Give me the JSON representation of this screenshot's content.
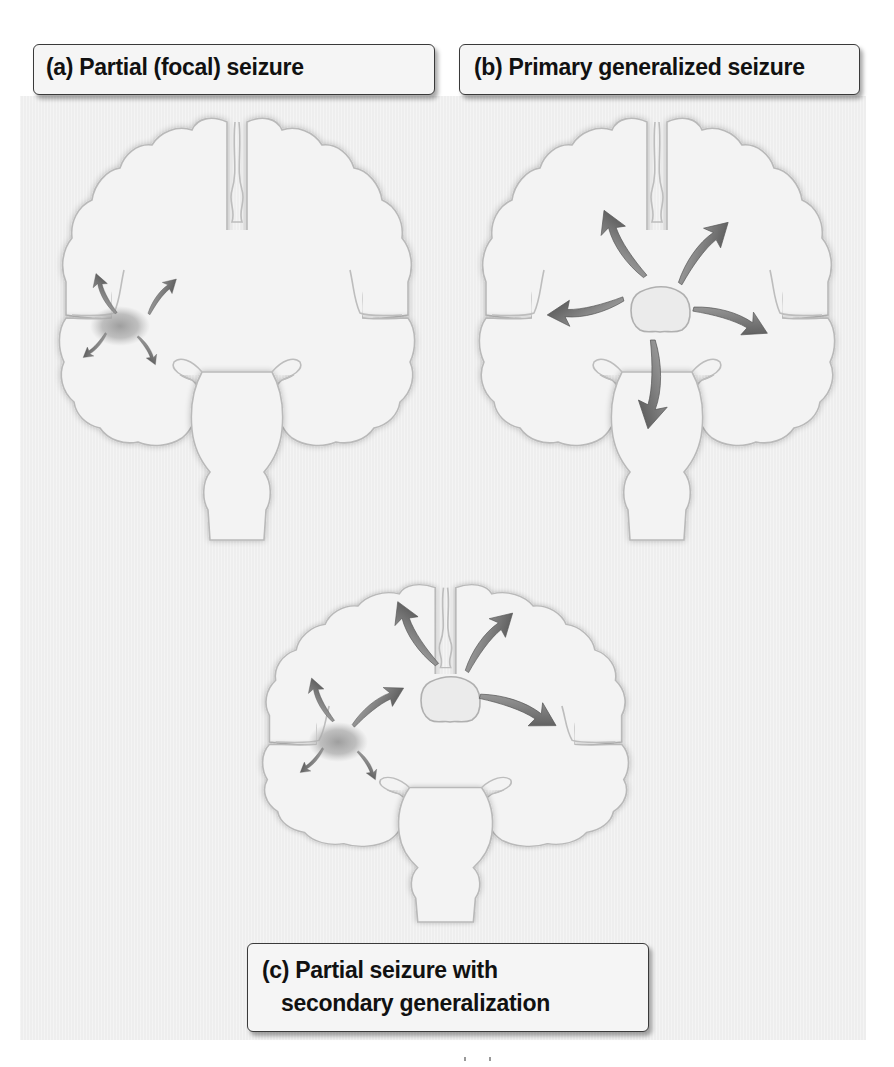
{
  "figure": {
    "panels": [
      {
        "id": "a",
        "label": "(a) Partial (focal) seizure",
        "description": "Seizure activity confined to a focal region of the temporal lobe, with short arrows spreading locally"
      },
      {
        "id": "b",
        "label": "(b) Primary generalized seizure",
        "description": "Seizure activity originating centrally (thalamus) and spreading to both hemispheres and brainstem"
      },
      {
        "id": "c",
        "label_line1": "(c) Partial seizure with",
        "label_line2": "secondary generalization",
        "description": "Focal temporal seizure spreading to the thalamus and then generalizing to both hemispheres"
      }
    ],
    "colors": {
      "background_panel": "#eeeeee",
      "brain_fill": "#f3f3f3",
      "brain_outline": "#b9b9b9",
      "arrow_dark": "#5a5a5a",
      "arrow_light": "#a8a8a8",
      "focus_spot": "#9a9a9a",
      "label_border": "#3a3a3a",
      "label_text": "#111111"
    },
    "icons": [
      "brain-coronal-section-icon",
      "spread-arrow-icon",
      "seizure-focus-icon",
      "thalamus-icon"
    ]
  }
}
